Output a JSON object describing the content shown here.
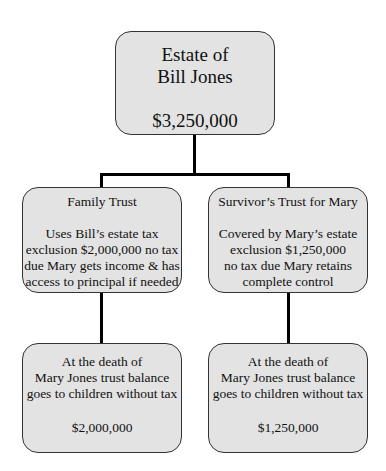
{
  "diagram": {
    "colors": {
      "box_fill": "#e3e3e3",
      "box_border": "#333333",
      "connector": "#000000"
    },
    "root": {
      "title_lines": [
        "Estate of",
        "Bill Jones"
      ],
      "amount": "$3,250,000"
    },
    "middle": [
      {
        "title": "Family Trust",
        "desc_lines": [
          "Uses Bill’s estate tax",
          "exclusion $2,000,000 no tax",
          "due Mary gets income & has",
          "access to principal if needed"
        ]
      },
      {
        "title": "Survivor’s Trust for Mary",
        "desc_lines": [
          "Covered by Mary’s estate",
          "exclusion $1,250,000",
          "no tax due Mary retains",
          "complete control"
        ]
      }
    ],
    "bottom": [
      {
        "desc_lines": [
          "At the death of",
          "Mary Jones trust balance",
          "goes to children without tax"
        ],
        "amount": "$2,000,000"
      },
      {
        "desc_lines": [
          "At the death of",
          "Mary Jones trust balance",
          "goes to children without tax"
        ],
        "amount": "$1,250,000"
      }
    ]
  }
}
